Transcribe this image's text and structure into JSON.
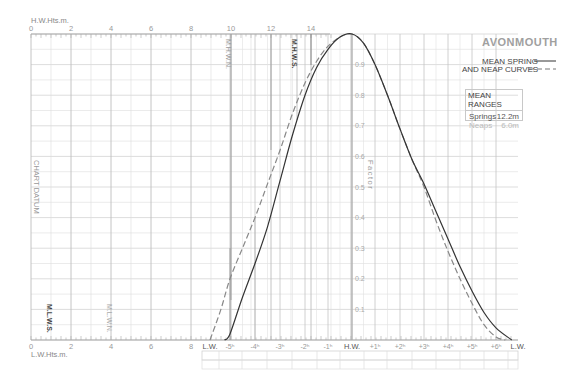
{
  "header": {
    "port_name": "AVONMOUTH",
    "legend": {
      "line1": "MEAN SPRING",
      "line2": "AND NEAP CURVES",
      "spring_style": "solid",
      "neap_style": "dashed"
    },
    "mean_ranges": {
      "title": "MEAN RANGES",
      "springs_label": "Springs",
      "springs_value": "12.2m",
      "neaps_label": "Neaps",
      "neaps_value": "6.0m"
    }
  },
  "axes": {
    "hw_heights_label": "H.W.Hts.m.",
    "lw_heights_label": "L.W.Hts.m.",
    "hw_ticks": [
      "0",
      "2",
      "4",
      "6",
      "8",
      "10",
      "12",
      "14"
    ],
    "lw_ticks": [
      "0",
      "2",
      "4",
      "6",
      "8"
    ],
    "factor_label": "Factor",
    "chart_datum_label": "CHART DATUM",
    "level_labels": {
      "mhws": "M.H.W.S.",
      "mhwn": "M.H.W.N.",
      "mlws": "M.L.W.S.",
      "mlwn": "M.L.W.N."
    },
    "time_ticks": [
      "L.W.",
      "-5h",
      "-4h",
      "-3h",
      "-2h",
      "-1h",
      "H.W.",
      "+1h",
      "+2h",
      "+3h",
      "+4h",
      "+5h",
      "+6h",
      "L.W."
    ]
  },
  "colors": {
    "grid": "#d6d6d6",
    "grid_major": "#bdbdbd",
    "spring_curve": "#333333",
    "neap_curve": "#888888",
    "text_dark": "#444444",
    "text_light": "#a0a0a0"
  },
  "chart_data": {
    "type": "line",
    "title": "AVONMOUTH",
    "xlabel": "Time relative to H.W. (hours)",
    "ylabel": "Factor",
    "ylim": [
      0,
      1.0
    ],
    "xlim": [
      -6.1,
      6.7
    ],
    "y_ticks": [
      0.1,
      0.2,
      0.3,
      0.4,
      0.5,
      0.6,
      0.7,
      0.8,
      0.9
    ],
    "grid": true,
    "series": [
      {
        "name": "Mean Spring curve",
        "style": "solid",
        "x": [
          -5.3,
          -5.0,
          -4.5,
          -4.0,
          -3.5,
          -3.0,
          -2.5,
          -2.0,
          -1.5,
          -1.0,
          -0.5,
          0.0,
          0.5,
          1.0,
          1.5,
          2.0,
          2.5,
          3.0,
          3.5,
          4.0,
          4.5,
          5.0,
          5.5,
          6.0,
          6.5
        ],
        "y": [
          0.0,
          0.02,
          0.14,
          0.25,
          0.37,
          0.52,
          0.67,
          0.8,
          0.89,
          0.95,
          0.99,
          1.0,
          0.97,
          0.9,
          0.8,
          0.69,
          0.59,
          0.51,
          0.42,
          0.33,
          0.24,
          0.16,
          0.09,
          0.04,
          0.0
        ]
      },
      {
        "name": "Mean Neap curve",
        "style": "dashed",
        "x": [
          -6.1,
          -5.5,
          -5.0,
          -4.5,
          -4.0,
          -3.5,
          -3.0,
          -2.5,
          -2.0,
          -1.5,
          -1.0,
          -0.5,
          0.0,
          0.5,
          1.0,
          1.5,
          2.0,
          2.5,
          3.0,
          3.5,
          4.0,
          4.5,
          5.0,
          5.5,
          6.0,
          6.3
        ],
        "y": [
          0.0,
          0.1,
          0.2,
          0.3,
          0.4,
          0.51,
          0.62,
          0.74,
          0.84,
          0.91,
          0.96,
          0.99,
          1.0,
          0.97,
          0.9,
          0.8,
          0.69,
          0.59,
          0.5,
          0.39,
          0.29,
          0.2,
          0.12,
          0.05,
          0.01,
          0.0
        ]
      }
    ],
    "height_scale": {
      "hw_heights_m": [
        0,
        2,
        4,
        6,
        8,
        10,
        12,
        14
      ],
      "lw_heights_m": [
        0,
        2,
        4,
        6,
        8
      ],
      "MHWS_m": 13.3,
      "MHWN_m": 10.0,
      "MLWS_m": 1.0,
      "MLWN_m": 4.0
    },
    "mean_ranges": {
      "springs_m": 12.2,
      "neaps_m": 6.0
    }
  }
}
